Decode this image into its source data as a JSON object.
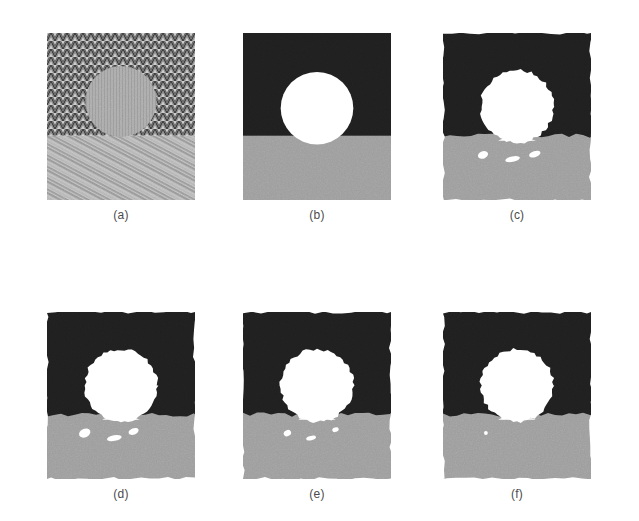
{
  "figure": {
    "background_color": "#ffffff",
    "layout": {
      "rows": 2,
      "cols": 3
    },
    "palette": {
      "region_dark": "#1f1f1f",
      "region_gray": "#9d9d9d",
      "region_white": "#ffffff",
      "caption_color": "#4b4b4b",
      "texture_light": "#d8d8d8",
      "texture_mid": "#a8a8a8",
      "texture_dark": "#3a3a3a"
    },
    "panels": [
      {
        "id": "a",
        "caption": "(a)",
        "kind": "textured-input",
        "description": "Original textured test image: herringbone zigzag texture in the upper region, a smooth circular disc region in the centre, and a diagonal streak texture in the lower band.",
        "regions": [
          "herringbone-upper",
          "disc-center",
          "diagonal-lower"
        ],
        "x": 47,
        "y": 33,
        "width": 148,
        "height": 167
      },
      {
        "id": "b",
        "caption": "(b)",
        "kind": "ground-truth",
        "description": "Ideal ground-truth segmentation: three regions with perfectly straight horizontal boundary and an exact circle.",
        "regions": [
          "dark-upper",
          "white-circle",
          "gray-lower"
        ],
        "boundary_straight": true,
        "circle_cx": 0.5,
        "circle_cy": 0.45,
        "circle_r": 0.245,
        "split_y": 0.615,
        "speckles": [],
        "x": 243,
        "y": 33,
        "width": 148,
        "height": 167
      },
      {
        "id": "c",
        "caption": "(c)",
        "kind": "segmentation-result",
        "description": "Segmentation result with ragged region boundaries, a deformed circle that bleeds into the lower region, and three small white speckle artifacts.",
        "regions": [
          "dark-upper",
          "white-circle",
          "gray-lower"
        ],
        "boundary_straight": false,
        "circle_cx": 0.5,
        "circle_cy": 0.44,
        "circle_r": 0.245,
        "split_y": 0.615,
        "speckles": [
          {
            "cx": 0.27,
            "cy": 0.73,
            "rx": 0.035,
            "ry": 0.022,
            "rot": -20
          },
          {
            "cx": 0.47,
            "cy": 0.755,
            "rx": 0.05,
            "ry": 0.016,
            "rot": -12
          },
          {
            "cx": 0.62,
            "cy": 0.725,
            "rx": 0.04,
            "ry": 0.018,
            "rot": -18
          }
        ],
        "x": 443,
        "y": 33,
        "width": 148,
        "height": 167
      },
      {
        "id": "d",
        "caption": "(d)",
        "kind": "segmentation-result",
        "description": "Segmentation result with ragged boundaries and three white speckle artifacts inside the lower gray region.",
        "regions": [
          "dark-upper",
          "white-circle",
          "gray-lower"
        ],
        "boundary_straight": false,
        "circle_cx": 0.5,
        "circle_cy": 0.44,
        "circle_r": 0.245,
        "split_y": 0.615,
        "speckles": [
          {
            "cx": 0.255,
            "cy": 0.725,
            "rx": 0.04,
            "ry": 0.026,
            "rot": -25
          },
          {
            "cx": 0.455,
            "cy": 0.755,
            "rx": 0.05,
            "ry": 0.017,
            "rot": -10
          },
          {
            "cx": 0.585,
            "cy": 0.715,
            "rx": 0.035,
            "ry": 0.019,
            "rot": -20
          }
        ],
        "x": 47,
        "y": 312,
        "width": 148,
        "height": 167
      },
      {
        "id": "e",
        "caption": "(e)",
        "kind": "segmentation-result",
        "description": "Cleaner segmentation result with only two small speckle artifacts remaining in the lower gray region.",
        "regions": [
          "dark-upper",
          "white-circle",
          "gray-lower"
        ],
        "boundary_straight": false,
        "circle_cx": 0.5,
        "circle_cy": 0.44,
        "circle_r": 0.245,
        "split_y": 0.615,
        "speckles": [
          {
            "cx": 0.3,
            "cy": 0.725,
            "rx": 0.026,
            "ry": 0.018,
            "rot": -25
          },
          {
            "cx": 0.46,
            "cy": 0.755,
            "rx": 0.034,
            "ry": 0.013,
            "rot": -12
          },
          {
            "cx": 0.625,
            "cy": 0.705,
            "rx": 0.022,
            "ry": 0.013,
            "rot": -18
          }
        ],
        "x": 243,
        "y": 312,
        "width": 148,
        "height": 167
      },
      {
        "id": "f",
        "caption": "(f)",
        "kind": "segmentation-result",
        "description": "Cleanest segmentation result: smooth circle and a single residual white dot in the lower gray region.",
        "regions": [
          "dark-upper",
          "white-circle",
          "gray-lower"
        ],
        "boundary_straight": false,
        "circle_cx": 0.5,
        "circle_cy": 0.44,
        "circle_r": 0.245,
        "split_y": 0.615,
        "speckles": [
          {
            "cx": 0.29,
            "cy": 0.725,
            "rx": 0.013,
            "ry": 0.012,
            "rot": 0
          }
        ],
        "x": 443,
        "y": 312,
        "width": 148,
        "height": 167
      }
    ]
  }
}
